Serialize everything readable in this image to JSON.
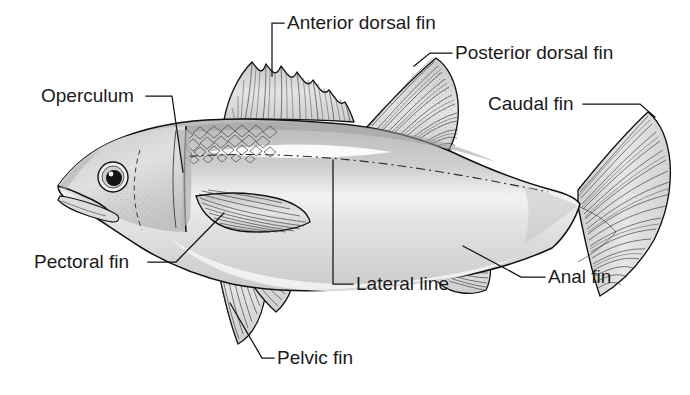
{
  "figure": {
    "background_color": "#ffffff",
    "ink_color": "#111111",
    "body_fill": "#d9d9d9",
    "body_fill_light": "#ececec",
    "fin_fill": "#d2d2d2",
    "label_color": "#1a1a1a",
    "label_font_size_px": 19
  },
  "labels": [
    {
      "id": "anterior-dorsal-fin",
      "text": "Anterior dorsal fin",
      "x": 287,
      "y": 29,
      "anchor": "start"
    },
    {
      "id": "posterior-dorsal-fin",
      "text": "Posterior dorsal fin",
      "x": 455,
      "y": 59,
      "anchor": "start"
    },
    {
      "id": "caudal-fin",
      "text": "Caudal fin",
      "x": 488,
      "y": 110,
      "anchor": "start"
    },
    {
      "id": "operculum",
      "text": "Operculum",
      "x": 41,
      "y": 102,
      "anchor": "start"
    },
    {
      "id": "pectoral-fin",
      "text": "Pectoral fin",
      "x": 34,
      "y": 268,
      "anchor": "start"
    },
    {
      "id": "pelvic-fin",
      "text": "Pelvic fin",
      "x": 277,
      "y": 364,
      "anchor": "start"
    },
    {
      "id": "lateral-line",
      "text": "Lateral line",
      "x": 356,
      "y": 290,
      "anchor": "start"
    },
    {
      "id": "anal-fin",
      "text": "Anal fin",
      "x": 548,
      "y": 283,
      "anchor": "start"
    }
  ],
  "parts": [
    "operculum",
    "anterior dorsal fin",
    "posterior dorsal fin",
    "caudal fin",
    "pectoral fin",
    "pelvic fin",
    "anal fin",
    "lateral line"
  ]
}
